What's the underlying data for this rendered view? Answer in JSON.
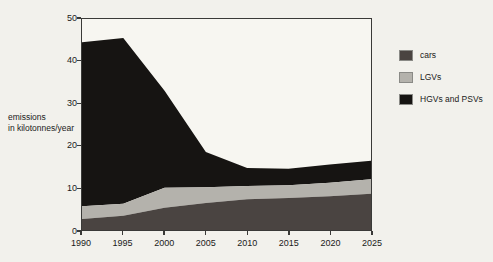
{
  "chart_data": {
    "type": "area",
    "stacked": true,
    "title": "",
    "xlabel": "",
    "ylabel": "emissions\nin kilotonnes/year",
    "ylabel_line1": "emissions",
    "ylabel_line2": "in kilotonnes/year",
    "x": [
      1990,
      1995,
      2000,
      2005,
      2010,
      2015,
      2020,
      2025
    ],
    "categories": [
      "1990",
      "1995",
      "2000",
      "2005",
      "2010",
      "2015",
      "2020",
      "2025"
    ],
    "xlim": [
      1990,
      2025
    ],
    "ylim": [
      0,
      50
    ],
    "yticks": [
      0,
      10,
      20,
      30,
      40,
      50
    ],
    "ytick_labels": [
      "0",
      "10",
      "20",
      "30",
      "40",
      "50"
    ],
    "xticks": [
      1990,
      1995,
      2000,
      2005,
      2010,
      2015,
      2020,
      2025
    ],
    "xtick_labels": [
      "1990",
      "1995",
      "2000",
      "2005",
      "2010",
      "2015",
      "2020",
      "2025"
    ],
    "grid": false,
    "legend_position": "right",
    "series": [
      {
        "name": "cars",
        "color": "#4a4441",
        "values": [
          2.6,
          3.4,
          5.3,
          6.4,
          7.3,
          7.6,
          8.0,
          8.6
        ]
      },
      {
        "name": "LGVs",
        "color": "#b4b2ac",
        "values": [
          3.0,
          2.8,
          4.7,
          3.7,
          3.1,
          3.0,
          3.2,
          3.4
        ]
      },
      {
        "name": "HGVs and PSVs",
        "color": "#161412",
        "values": [
          38.9,
          39.3,
          23.0,
          8.4,
          4.3,
          3.9,
          4.3,
          4.4
        ]
      }
    ],
    "cumulative_tops": {
      "cars": [
        2.6,
        3.4,
        5.3,
        6.4,
        7.3,
        7.6,
        8.0,
        8.6
      ],
      "LGVs": [
        5.6,
        6.2,
        10.0,
        10.1,
        10.4,
        10.6,
        11.2,
        12.0
      ],
      "total": [
        44.5,
        45.5,
        33.0,
        18.5,
        14.7,
        14.5,
        15.5,
        16.4
      ]
    }
  },
  "legend": {
    "items": [
      {
        "label": "cars",
        "color": "#4a4441"
      },
      {
        "label": "LGVs",
        "color": "#b4b2ac"
      },
      {
        "label": "HGVs and PSVs",
        "color": "#161412"
      }
    ]
  },
  "colors": {
    "background": "#f2f1ec",
    "plot_background": "#f7f6f1",
    "axis": "#3a3a38",
    "text": "#1a1a1a"
  }
}
